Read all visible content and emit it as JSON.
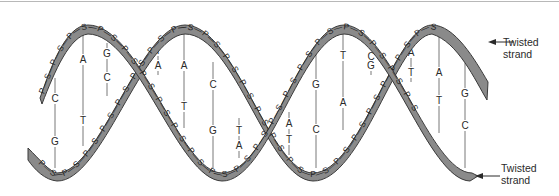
{
  "diagram": {
    "colors": {
      "strand_fill": "#8a8a8a",
      "strand_edge": "#3a3a3a",
      "text": "#2a2a2a",
      "rung": "#555555",
      "background": "#ffffff"
    },
    "labels": {
      "top_strand": {
        "line1": "Twisted",
        "line2": "strand"
      },
      "bottom_strand": {
        "line1": "Twisted",
        "line2": "strand"
      }
    },
    "strand_unit_letters": [
      "P",
      "S"
    ],
    "base_pairs": [
      {
        "x": 55,
        "top": "C",
        "top_y": 100,
        "bottom": "G",
        "bottom_y": 143,
        "y1": 78,
        "y2": 168
      },
      {
        "x": 83,
        "top": "A",
        "top_y": 61,
        "bottom": "T",
        "bottom_y": 122,
        "y1": 30,
        "y2": 146
      },
      {
        "x": 107,
        "top": "G",
        "top_y": 55,
        "bottom": "C",
        "bottom_y": 79,
        "y1": 43,
        "y2": 96
      },
      {
        "x": 158,
        "top": "T",
        "top_y": 52,
        "bottom": "A",
        "bottom_y": 67,
        "y1": 43,
        "y2": 75
      },
      {
        "x": 184,
        "top": "A",
        "top_y": 67,
        "bottom": "T",
        "bottom_y": 108,
        "y1": 28,
        "y2": 128
      },
      {
        "x": 213,
        "top": "C",
        "top_y": 86,
        "bottom": "G",
        "bottom_y": 132,
        "y1": 62,
        "y2": 168
      },
      {
        "x": 239,
        "top": "T",
        "top_y": 132,
        "bottom": "A",
        "bottom_y": 147,
        "y1": 118,
        "y2": 158
      },
      {
        "x": 289,
        "top": "A",
        "top_y": 125,
        "bottom": "T",
        "bottom_y": 141,
        "y1": 112,
        "y2": 155
      },
      {
        "x": 316,
        "top": "G",
        "top_y": 86,
        "bottom": "C",
        "bottom_y": 131,
        "y1": 52,
        "y2": 168
      },
      {
        "x": 343,
        "top": "T",
        "top_y": 57,
        "bottom": "A",
        "bottom_y": 104,
        "y1": 28,
        "y2": 130
      },
      {
        "x": 371,
        "top": "C",
        "top_y": 58,
        "bottom": "G",
        "bottom_y": 67,
        "y1": 50,
        "y2": 75
      },
      {
        "x": 411,
        "top": "A",
        "top_y": 54,
        "bottom": "T",
        "bottom_y": 74,
        "y1": 45,
        "y2": 82
      },
      {
        "x": 439,
        "top": "A",
        "top_y": 74,
        "bottom": "T",
        "bottom_y": 102,
        "y1": 28,
        "y2": 133
      },
      {
        "x": 465,
        "top": "G",
        "top_y": 95,
        "bottom": "C",
        "bottom_y": 127,
        "y1": 62,
        "y2": 168
      }
    ]
  }
}
